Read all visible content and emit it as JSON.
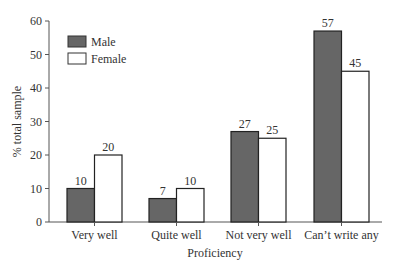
{
  "chart_data": {
    "type": "bar",
    "title": "",
    "xlabel": "Proficiency",
    "ylabel": "% total sample",
    "ylim": [
      0,
      60
    ],
    "yticks": [
      0,
      10,
      20,
      30,
      40,
      50,
      60
    ],
    "grid": false,
    "legend_position": "upper left",
    "categories": [
      "Very well",
      "Quite well",
      "Not very well",
      "Can’t write any"
    ],
    "series": [
      {
        "name": "Male",
        "values": [
          10,
          7,
          27,
          57
        ],
        "color": "#666666"
      },
      {
        "name": "Female",
        "values": [
          20,
          10,
          25,
          45
        ],
        "color": "#ffffff"
      }
    ],
    "data_labels": true
  },
  "legend": {
    "items": [
      {
        "label": "Male"
      },
      {
        "label": "Female"
      }
    ]
  },
  "axes": {
    "xlabel": "Proficiency",
    "ylabel": "% total sample"
  }
}
